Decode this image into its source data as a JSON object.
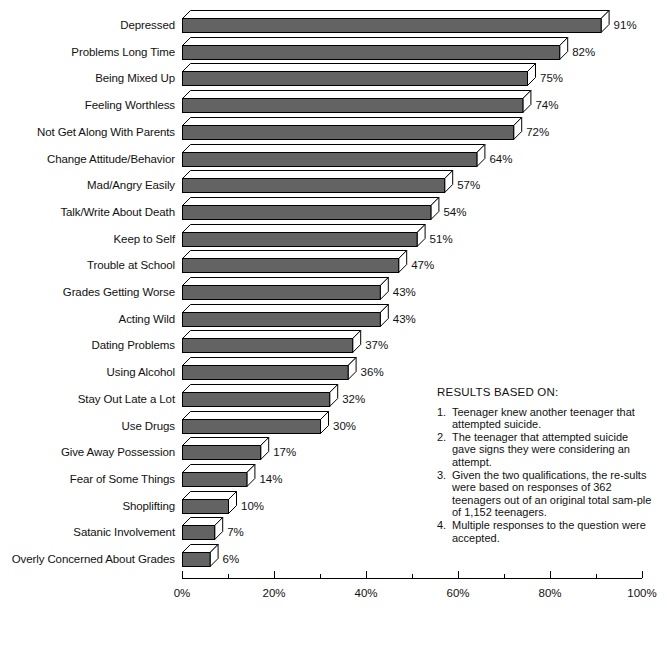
{
  "chart_data": {
    "type": "bar",
    "orientation": "horizontal",
    "title": "",
    "xlabel": "",
    "ylabel": "",
    "xlim": [
      0,
      100
    ],
    "grid": false,
    "legend": null,
    "unit": "%",
    "categories": [
      "Depressed",
      "Problems Long Time",
      "Being Mixed Up",
      "Feeling Worthless",
      "Not Get Along With Parents",
      "Change Attitude/Behavior",
      "Mad/Angry Easily",
      "Talk/Write About Death",
      "Keep to Self",
      "Trouble at School",
      "Grades Getting Worse",
      "Acting Wild",
      "Dating Problems",
      "Using Alcohol",
      "Stay Out Late a Lot",
      "Use Drugs",
      "Give Away Possession",
      "Fear of Some Things",
      "Shoplifting",
      "Satanic Involvement",
      "Overly Concerned About Grades"
    ],
    "values": [
      91,
      82,
      75,
      74,
      72,
      64,
      57,
      54,
      51,
      47,
      43,
      43,
      37,
      36,
      32,
      30,
      17,
      14,
      10,
      7,
      6
    ],
    "value_labels": [
      "91%",
      "82%",
      "75%",
      "74%",
      "72%",
      "64%",
      "57%",
      "54%",
      "51%",
      "47%",
      "43%",
      "43%",
      "37%",
      "36%",
      "32%",
      "30%",
      "17%",
      "14%",
      "10%",
      "7%",
      "6%"
    ],
    "xticks": [
      0,
      20,
      40,
      60,
      80,
      100
    ],
    "xtick_labels": [
      "0%",
      "20%",
      "40%",
      "60%",
      "80%",
      "100%"
    ],
    "minor_xticks": [
      10,
      30,
      50,
      70,
      90
    ],
    "bar_color": "#636363",
    "bar_top_color": "#ffffff",
    "bar_side_color": "#ffffff",
    "outline_color": "#000000"
  },
  "notes": {
    "title": "RESULTS BASED ON:",
    "items": [
      {
        "num": "1.",
        "text": "Teenager knew another teenager that attempted suicide."
      },
      {
        "num": "2.",
        "text": "The teenager that attempted suicide gave signs they were considering an attempt."
      },
      {
        "num": "3.",
        "text": "Given the two qualifications, the re-sults were based on responses of 362 teenagers out of an original total sam-ple of 1,152 teenagers."
      },
      {
        "num": "4.",
        "text": "Multiple responses to the question were accepted."
      }
    ]
  }
}
